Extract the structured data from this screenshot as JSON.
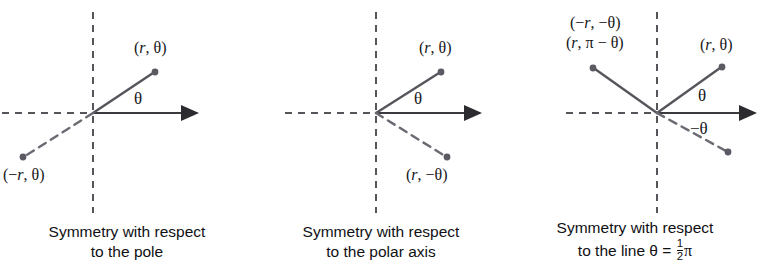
{
  "figure": {
    "colors": {
      "axis_solid": "#3a3a3f",
      "axis_dashed": "#55555c",
      "ray_solid": "#55555c",
      "ray_dashed": "#6a6a72",
      "point": "#5a5a62",
      "text": "#101014",
      "background": "#ffffff"
    }
  },
  "panels": [
    {
      "id": "panel-1",
      "name": "symmetry-with-respect-to-the-pole",
      "origin": {
        "x": 93,
        "y": 113
      },
      "axes": {
        "horizontal_solid": {
          "x1": 93,
          "y1": 113,
          "x2": 203,
          "y2": 113,
          "arrow": true
        },
        "horizontal_dashed": {
          "x1": 2,
          "y1": 113,
          "x2": 93,
          "y2": 113
        },
        "vertical_dashed": {
          "x1": 93,
          "y1": 12,
          "x2": 93,
          "y2": 213
        }
      },
      "rays": [
        {
          "name": "ray-solid-r-theta",
          "style": "solid",
          "x1": 93,
          "y1": 113,
          "x2": 155,
          "y2": 72
        },
        {
          "name": "ray-dashed-neg-r-theta",
          "style": "dashed",
          "x1": 93,
          "y1": 113,
          "x2": 23,
          "y2": 157
        }
      ],
      "points": [
        {
          "name": "point-r-theta",
          "x": 155,
          "y": 72
        },
        {
          "name": "point-neg-r-theta",
          "x": 23,
          "y": 157
        }
      ],
      "labels": [
        {
          "name": "label-r-theta",
          "text": "(r, θ)",
          "x": 134,
          "y": 53,
          "italic_part": "r"
        },
        {
          "name": "label-neg-r-theta",
          "text": "(−r, θ)",
          "x": 3,
          "y": 180,
          "italic_part": "r"
        },
        {
          "name": "label-angle-theta",
          "text": "θ",
          "x": 134,
          "y": 104
        }
      ],
      "caption": {
        "line1": "Symmetry with respect",
        "line2": "to the pole"
      }
    },
    {
      "id": "panel-2",
      "name": "symmetry-with-respect-to-the-polar-axis",
      "origin": {
        "x": 122,
        "y": 113
      },
      "axes": {
        "horizontal_solid": {
          "x1": 122,
          "y1": 113,
          "x2": 232,
          "y2": 113,
          "arrow": true
        },
        "horizontal_dashed": {
          "x1": 31,
          "y1": 113,
          "x2": 122,
          "y2": 113
        },
        "vertical_dashed": {
          "x1": 122,
          "y1": 12,
          "x2": 122,
          "y2": 213
        }
      },
      "rays": [
        {
          "name": "ray-solid-r-theta",
          "style": "solid",
          "x1": 122,
          "y1": 113,
          "x2": 187,
          "y2": 72
        },
        {
          "name": "ray-dashed-r-neg-theta",
          "style": "dashed",
          "x1": 122,
          "y1": 113,
          "x2": 193,
          "y2": 157
        }
      ],
      "points": [
        {
          "name": "point-r-theta",
          "x": 187,
          "y": 72
        },
        {
          "name": "point-r-neg-theta",
          "x": 193,
          "y": 157
        }
      ],
      "labels": [
        {
          "name": "label-r-theta",
          "text": "(r, θ)",
          "x": 165,
          "y": 53,
          "italic_part": "r"
        },
        {
          "name": "label-r-neg-theta",
          "text": "(r, −θ)",
          "x": 152,
          "y": 180,
          "italic_part": "r"
        },
        {
          "name": "label-angle-theta",
          "text": "θ",
          "x": 160,
          "y": 104
        }
      ],
      "caption": {
        "line1": "Symmetry with respect",
        "line2": "to the polar axis"
      }
    },
    {
      "id": "panel-3",
      "name": "symmetry-with-respect-to-the-line-theta-equals-half-pi",
      "origin": {
        "x": 149,
        "y": 113
      },
      "axes": {
        "horizontal_solid": {
          "x1": 149,
          "y1": 113,
          "x2": 252,
          "y2": 113,
          "arrow": true
        },
        "horizontal_dashed": {
          "x1": 58,
          "y1": 113,
          "x2": 149,
          "y2": 113
        },
        "vertical_dashed": {
          "x1": 149,
          "y1": 12,
          "x2": 149,
          "y2": 213
        }
      },
      "rays": [
        {
          "name": "ray-solid-r-theta",
          "style": "solid",
          "x1": 149,
          "y1": 113,
          "x2": 214,
          "y2": 67
        },
        {
          "name": "ray-solid-neg-r-neg-theta",
          "style": "solid",
          "x1": 149,
          "y1": 113,
          "x2": 85,
          "y2": 68
        },
        {
          "name": "ray-dashed-neg-theta",
          "style": "dashed",
          "x1": 149,
          "y1": 113,
          "x2": 220,
          "y2": 152
        }
      ],
      "points": [
        {
          "name": "point-r-theta",
          "x": 214,
          "y": 67
        },
        {
          "name": "point-neg-r-neg-theta",
          "x": 85,
          "y": 68
        },
        {
          "name": "point-dashed-neg-theta",
          "x": 220,
          "y": 152
        }
      ],
      "labels": [
        {
          "name": "label-neg-r-neg-theta",
          "text": "(−r, −θ)",
          "x": 62,
          "y": 28,
          "italic_part": "r"
        },
        {
          "name": "label-r-pi-minus-theta",
          "text": "(r, π − θ)",
          "x": 58,
          "y": 48,
          "italic_part": "r"
        },
        {
          "name": "label-r-theta",
          "text": "(r, θ)",
          "x": 192,
          "y": 50,
          "italic_part": "r"
        },
        {
          "name": "label-angle-theta",
          "text": "θ",
          "x": 190,
          "y": 101
        },
        {
          "name": "label-angle-neg-theta",
          "text": "−θ",
          "x": 186,
          "y": 133
        }
      ],
      "caption": {
        "line1": "Symmetry with respect",
        "line2_prefix": "to the line θ = ",
        "fraction_numerator": "1",
        "fraction_denominator": "2",
        "line2_suffix": "π"
      }
    }
  ]
}
